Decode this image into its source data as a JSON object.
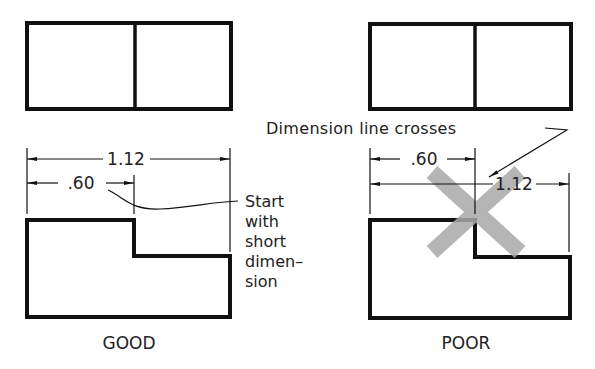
{
  "good": {
    "caption": "GOOD",
    "dim_long": "1.12",
    "dim_short": ".60",
    "note": [
      "Start",
      "with",
      "short",
      "dimen–",
      "sion"
    ]
  },
  "poor": {
    "caption": "POOR",
    "dim_long": "1.12",
    "dim_short": ".60",
    "note": "Dimension line crosses"
  },
  "colors": {
    "line": "#111111",
    "cross": "#a9a9a9"
  }
}
